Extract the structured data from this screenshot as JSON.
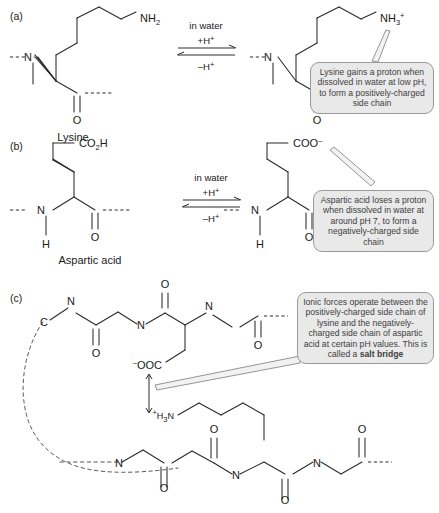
{
  "figure": {
    "background_color": "#ffffff",
    "callout_fill": "#e9e9e9",
    "callout_border": "#9a9a9a",
    "bond_color": "#2a2a2a"
  },
  "panels": [
    {
      "id": "a",
      "label": "(a)",
      "molecule_name": "Lysine",
      "left_group": "NH2",
      "right_group": "NH3+",
      "reaction": {
        "condition": "in water",
        "forward": "+H+",
        "reverse": "–H+"
      },
      "callout": "Lysine gains a proton when dissolved in water at low pH, to form a positively-charged side chain"
    },
    {
      "id": "b",
      "label": "(b)",
      "molecule_name": "Aspartic acid",
      "left_group": "CO2H",
      "right_group": "COO-",
      "reaction": {
        "condition": "in water",
        "forward": "+H+",
        "reverse": "–H+"
      },
      "callout": "Aspartic acid loses a proton when dissolved in water at around pH 7, to form a negatively-charged side chain"
    },
    {
      "id": "c",
      "label": "(c)",
      "callout_prefix": "Ionic forces operate between the positively-charged side chain of lysine and the negatively-charged side chain of aspartic acid at certain pH values. This is called a ",
      "callout_bold": "salt bridge",
      "upper_chain_anion": "−OOC",
      "lower_chain_cation": "+H3N"
    }
  ],
  "atoms": {
    "N": "N",
    "H": "H",
    "O": "O",
    "C": "C",
    "NH": "NH",
    "CO": "CO",
    "COO": "COO",
    "OOC": "OOC",
    "H3N": "H",
    "two": "2",
    "three": "3",
    "plus": "+",
    "minus": "–",
    "minus_charge": "−"
  }
}
